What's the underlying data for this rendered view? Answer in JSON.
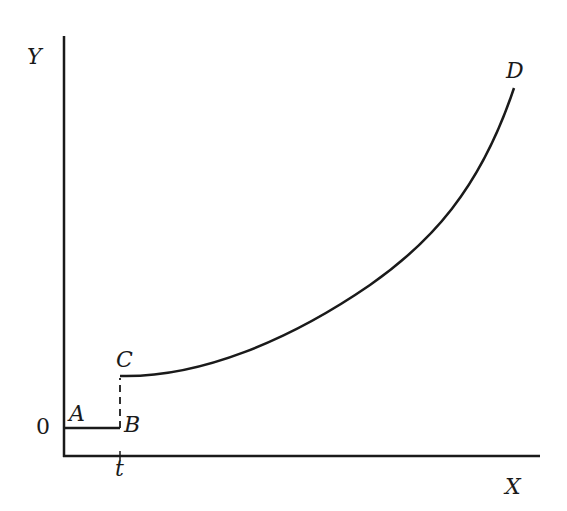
{
  "diagram": {
    "axes": {
      "y_label": "Y",
      "x_label": "X",
      "origin_label": "0",
      "x_tick_label": "t"
    },
    "points": {
      "A": "A",
      "B": "B",
      "C": "C",
      "D": "D"
    },
    "segments": [
      {
        "from": "A",
        "to": "B",
        "style": "solid",
        "description": "horizontal baseline from origin to t"
      },
      {
        "from": "B",
        "to": "C",
        "style": "dashed",
        "description": "vertical jump at t"
      },
      {
        "from": "C",
        "to": "D",
        "style": "solid",
        "description": "convex increasing curve"
      }
    ],
    "colors": {
      "ink": "#1a1a1a",
      "background": "#ffffff"
    }
  }
}
